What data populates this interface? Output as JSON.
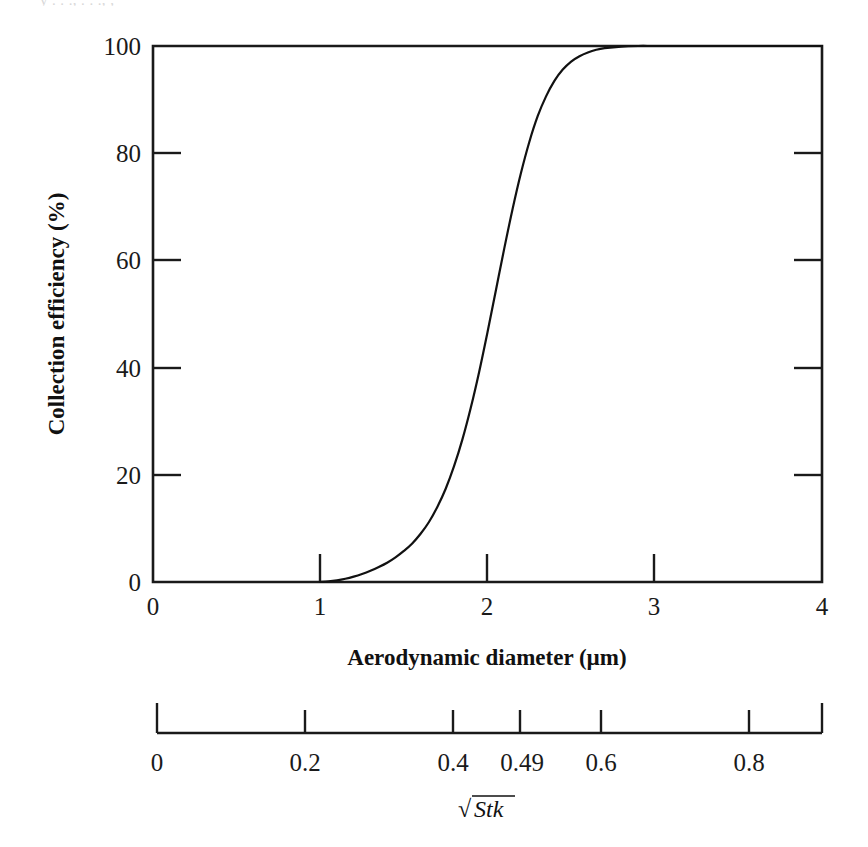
{
  "figure": {
    "background_color": "#ffffff",
    "ink_color": "#111111",
    "top_sliver_text": "y . . ., . . ., ,"
  },
  "chart_data": {
    "type": "line",
    "title": "",
    "subtitle": "",
    "xlabel": "Aerodynamic diameter (µm)",
    "ylabel": "Collection efficiency (%)",
    "xlim": [
      0,
      4
    ],
    "ylim": [
      0,
      100
    ],
    "grid": false,
    "legend": null,
    "legend_position": "none",
    "x_ticks": [
      0,
      1,
      2,
      3,
      4
    ],
    "x_tick_labels": [
      "0",
      "1",
      "2",
      "3",
      "4"
    ],
    "y_ticks": [
      0,
      20,
      40,
      60,
      80,
      100
    ],
    "y_tick_labels": [
      "0",
      "20",
      "40",
      "60",
      "80",
      "100"
    ],
    "series": [
      {
        "name": "Collection efficiency curve",
        "x": [
          1.0,
          1.05,
          1.1,
          1.15,
          1.2,
          1.25,
          1.3,
          1.35,
          1.4,
          1.45,
          1.5,
          1.55,
          1.6,
          1.65,
          1.7,
          1.75,
          1.8,
          1.85,
          1.9,
          1.95,
          2.0,
          2.05,
          2.1,
          2.15,
          2.2,
          2.25,
          2.3,
          2.35,
          2.4,
          2.45,
          2.5,
          2.55,
          2.6,
          2.65,
          2.7,
          2.8,
          2.9,
          3.0,
          3.2,
          3.5,
          4.0
        ],
        "y": [
          0.0,
          0.1,
          0.3,
          0.6,
          1.0,
          1.5,
          2.1,
          2.8,
          3.6,
          4.6,
          5.8,
          7.2,
          9.0,
          11.2,
          14.0,
          17.4,
          21.6,
          26.6,
          32.5,
          39.2,
          46.6,
          54.4,
          62.2,
          69.6,
          76.3,
          82.1,
          86.9,
          90.6,
          93.5,
          95.6,
          97.1,
          98.1,
          98.8,
          99.3,
          99.6,
          99.9,
          100.0,
          100.0,
          100.0,
          100.0,
          100.0
        ]
      }
    ],
    "secondary_axis": {
      "label": "√Stk",
      "label_parts": {
        "radical": "√",
        "symbol": "Stk"
      },
      "ticks": [
        0,
        0.2,
        0.4,
        0.49,
        0.6,
        0.8
      ],
      "tick_labels": [
        "0",
        "0.2",
        "0.4",
        "0.49",
        "0.6",
        "0.8"
      ],
      "range": [
        0,
        0.9
      ],
      "tick_direction": "up"
    },
    "annotations": [
      {
        "text": "curve is a sigmoidal collection-efficiency (cutpoint) curve",
        "visible": false
      }
    ]
  }
}
